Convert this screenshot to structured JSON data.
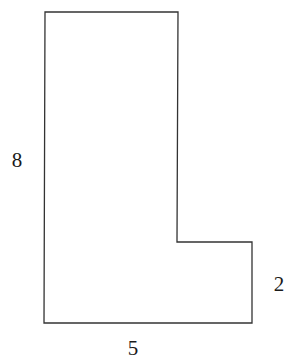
{
  "diagram": {
    "type": "L-shaped polygon",
    "stroke_color": "#333333",
    "background": "#ffffff",
    "shape": {
      "points": [
        [
          45,
          12
        ],
        [
          178,
          12
        ],
        [
          177,
          242
        ],
        [
          252,
          242
        ],
        [
          252,
          323
        ],
        [
          44,
          323
        ]
      ]
    },
    "labels": {
      "left": {
        "text": "8",
        "x": 17,
        "y": 160
      },
      "right": {
        "text": "2",
        "x": 279,
        "y": 284
      },
      "bottom": {
        "text": "5",
        "x": 133,
        "y": 348
      }
    }
  }
}
